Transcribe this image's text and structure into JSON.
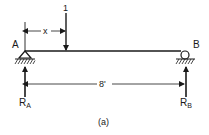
{
  "diagram": {
    "type": "simply-supported-beam",
    "caption": "(a)",
    "beam": {
      "span_label": "8'"
    },
    "support_a": {
      "label": "A",
      "kind": "pin"
    },
    "support_b": {
      "label": "B",
      "kind": "roller"
    },
    "load": {
      "label": "1",
      "position_label": "x"
    },
    "reactions": {
      "ra": {
        "main": "R",
        "sub": "A"
      },
      "rb": {
        "main": "R",
        "sub": "B"
      }
    },
    "colors": {
      "ink": "#1a1a1a",
      "background": "#ffffff"
    }
  }
}
